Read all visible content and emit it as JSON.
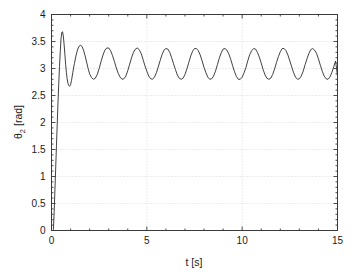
{
  "figure": {
    "name": "theta2-time-response-plot",
    "background_color": "#ffffff",
    "axis_color": "#3a3a3a",
    "grid_color": "#cccccc",
    "curve_color": "#2b2b2b"
  },
  "chart_data": {
    "type": "line",
    "title": "",
    "subtitle": "",
    "xlabel": "t [s]",
    "ylabel": "θ₂ [rad]",
    "ylabel_base": "θ",
    "ylabel_sub": "2",
    "ylabel_unit": " [rad]",
    "xlim": [
      0,
      15
    ],
    "ylim": [
      0,
      4
    ],
    "grid": true,
    "grid_style": "dotted",
    "legend": null,
    "legend_position": "none",
    "xticks": [
      0,
      5,
      10,
      15
    ],
    "xtick_labels": [
      "0",
      "5",
      "10",
      "15"
    ],
    "yticks": [
      0,
      0.5,
      1,
      1.5,
      2,
      2.5,
      3,
      3.5,
      4
    ],
    "ytick_labels": [
      "0",
      "0.5",
      "1",
      "1.5",
      "2",
      "2.5",
      "3",
      "3.5",
      "4"
    ],
    "series": [
      {
        "name": "theta2",
        "color": "#2b2b2b",
        "linewidth": 0.9,
        "x": [
          0.0,
          0.05,
          0.1,
          0.14,
          0.18,
          0.22,
          0.26,
          0.3,
          0.34,
          0.38,
          0.42,
          0.46,
          0.5,
          0.54,
          0.58,
          0.62,
          0.66,
          0.7,
          0.74,
          0.78,
          0.82,
          0.86,
          0.9,
          0.95,
          1.0,
          1.05,
          1.12,
          1.2,
          1.28,
          1.36,
          1.44,
          1.52,
          1.6,
          1.68,
          1.76,
          1.84,
          1.92,
          2.0,
          2.1,
          2.2,
          2.3,
          2.4,
          2.5,
          2.6,
          2.7,
          2.8,
          2.9,
          3.0,
          3.1,
          3.2,
          3.3,
          3.4,
          3.5,
          3.6,
          3.7,
          3.8,
          3.9,
          4.0,
          4.1,
          4.2,
          4.3,
          4.4,
          4.5,
          4.6,
          4.7,
          4.8,
          4.9,
          5.0,
          5.1,
          5.2,
          5.3,
          5.4,
          5.5,
          5.6,
          5.7,
          5.8,
          5.9,
          6.0,
          6.1,
          6.2,
          6.3,
          6.4,
          6.5,
          6.6,
          6.7,
          6.8,
          6.9,
          7.0,
          7.1,
          7.2,
          7.3,
          7.4,
          7.5,
          7.6,
          7.7,
          7.8,
          7.9,
          8.0,
          8.1,
          8.2,
          8.3,
          8.4,
          8.5,
          8.6,
          8.7,
          8.8,
          8.9,
          9.0,
          9.1,
          9.2,
          9.3,
          9.4,
          9.5,
          9.6,
          9.7,
          9.8,
          9.9,
          10.0,
          10.1,
          10.2,
          10.3,
          10.4,
          10.5,
          10.6,
          10.7,
          10.8,
          10.9,
          11.0,
          11.1,
          11.2,
          11.3,
          11.4,
          11.5,
          11.6,
          11.7,
          11.8,
          11.9,
          12.0,
          12.1,
          12.2,
          12.3,
          12.4,
          12.5,
          12.6,
          12.7,
          12.8,
          12.9,
          13.0,
          13.1,
          13.2,
          13.3,
          13.4,
          13.5,
          13.6,
          13.7,
          13.8,
          13.9,
          14.0,
          14.1,
          14.2,
          14.3,
          14.4,
          14.5,
          14.6,
          14.7,
          14.8,
          14.9,
          15.0
        ],
        "y": [
          0.0,
          0.0,
          0.02,
          0.35,
          0.75,
          1.16,
          1.57,
          1.97,
          2.36,
          2.72,
          3.04,
          3.32,
          3.55,
          3.67,
          3.68,
          3.6,
          3.45,
          3.27,
          3.08,
          2.93,
          2.81,
          2.73,
          2.69,
          2.67,
          2.7,
          2.78,
          2.93,
          3.09,
          3.23,
          3.34,
          3.41,
          3.43,
          3.41,
          3.34,
          3.24,
          3.12,
          3.0,
          2.9,
          2.83,
          2.8,
          2.82,
          2.89,
          3.0,
          3.13,
          3.25,
          3.34,
          3.38,
          3.38,
          3.33,
          3.24,
          3.13,
          3.01,
          2.91,
          2.84,
          2.8,
          2.81,
          2.86,
          2.96,
          3.08,
          3.2,
          3.3,
          3.36,
          3.38,
          3.35,
          3.28,
          3.17,
          3.05,
          2.95,
          2.86,
          2.81,
          2.8,
          2.84,
          2.92,
          3.03,
          3.15,
          3.26,
          3.34,
          3.37,
          3.36,
          3.3,
          3.2,
          3.09,
          2.98,
          2.88,
          2.82,
          2.8,
          2.82,
          2.89,
          2.99,
          3.11,
          3.23,
          3.32,
          3.37,
          3.37,
          3.33,
          3.25,
          3.14,
          3.02,
          2.92,
          2.84,
          2.8,
          2.81,
          2.86,
          2.95,
          3.07,
          3.19,
          3.29,
          3.36,
          3.37,
          3.34,
          3.27,
          3.17,
          3.05,
          2.94,
          2.85,
          2.8,
          2.8,
          2.84,
          2.92,
          3.02,
          3.15,
          3.26,
          3.33,
          3.37,
          3.36,
          3.3,
          3.21,
          3.1,
          2.98,
          2.88,
          2.82,
          2.8,
          2.82,
          2.89,
          2.99,
          3.11,
          3.22,
          3.31,
          3.37,
          3.37,
          3.33,
          3.25,
          3.14,
          3.03,
          2.92,
          2.84,
          2.8,
          2.81,
          2.86,
          2.95,
          3.07,
          3.18,
          3.28,
          3.35,
          3.37,
          3.34,
          3.28,
          3.18,
          3.06,
          2.95,
          2.86,
          2.81,
          2.8,
          2.84,
          2.92,
          3.03,
          3.14,
          2.86
        ]
      }
    ],
    "annotations": [],
    "notes": {
      "initial_peak_value": 3.68,
      "initial_peak_time": 0.55,
      "first_trough_value": 2.67,
      "first_trough_time": 0.95,
      "limit_cycle_max": 3.38,
      "limit_cycle_min": 2.8,
      "limit_cycle_period": 1.1,
      "final_value": 2.86
    }
  }
}
